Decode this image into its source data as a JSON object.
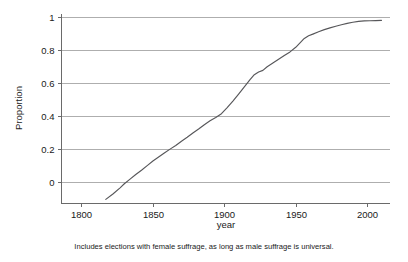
{
  "chart_data": {
    "type": "line",
    "title": "",
    "subtitle": "",
    "xlabel": "year",
    "ylabel": "Proportion",
    "xlim": [
      1786,
      2016
    ],
    "ylim": [
      -0.13,
      1.02
    ],
    "grid": "horizontal",
    "legend": "none",
    "x_ticks": [
      1800,
      1850,
      1900,
      1950,
      2000
    ],
    "x_tick_labels": [
      "1800",
      "1850",
      "1900",
      "1950",
      "2000"
    ],
    "y_ticks": [
      0,
      0.2,
      0.4,
      0.6,
      0.8,
      1
    ],
    "y_tick_labels": [
      "0",
      "0.2",
      "0.4",
      "0.6",
      "0.8",
      "1"
    ],
    "series": [
      {
        "name": "Proportion of elections",
        "color": "#57575a",
        "x": [
          1817,
          1822,
          1827,
          1830,
          1834,
          1838,
          1842,
          1846,
          1850,
          1854,
          1858,
          1862,
          1866,
          1870,
          1874,
          1878,
          1882,
          1886,
          1890,
          1894,
          1898,
          1902,
          1906,
          1910,
          1914,
          1918,
          1921,
          1924,
          1927,
          1930,
          1934,
          1938,
          1942,
          1946,
          1950,
          1953,
          1956,
          1959,
          1962,
          1966,
          1970,
          1974,
          1978,
          1982,
          1986,
          1990,
          1994,
          1998,
          2002,
          2006,
          2010
        ],
        "y": [
          -0.105,
          -0.072,
          -0.035,
          -0.01,
          0.018,
          0.046,
          0.072,
          0.1,
          0.128,
          0.152,
          0.176,
          0.2,
          0.222,
          0.248,
          0.272,
          0.298,
          0.322,
          0.348,
          0.372,
          0.392,
          0.415,
          0.452,
          0.492,
          0.534,
          0.578,
          0.622,
          0.652,
          0.668,
          0.678,
          0.7,
          0.722,
          0.745,
          0.768,
          0.79,
          0.818,
          0.845,
          0.872,
          0.888,
          0.898,
          0.912,
          0.925,
          0.936,
          0.946,
          0.955,
          0.963,
          0.97,
          0.975,
          0.978,
          0.979,
          0.98,
          0.981
        ]
      }
    ],
    "annotations": [
      "Includes elections with female suffrage, as long as male suffrage is universal."
    ]
  },
  "caption": {
    "text": "Includes elections with female suffrage, as long as male suffrage is universal."
  },
  "axes": {
    "x_title": "year",
    "y_title": "Proportion"
  },
  "colors": {
    "line": "#57575a",
    "grid": "#9a9a9a",
    "axis": "#6a6a6a",
    "background": "#ffffff",
    "text": "#1a1a1a"
  }
}
